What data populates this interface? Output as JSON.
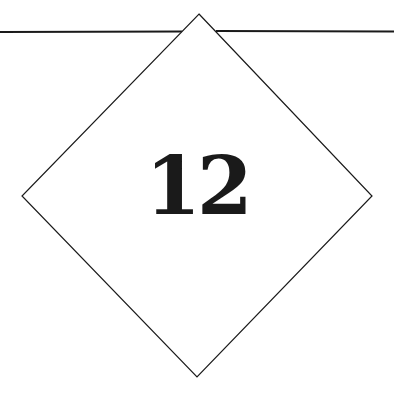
{
  "chapter": {
    "number": "12"
  },
  "colors": {
    "background": "#ffffff",
    "line": "#1a1a1a",
    "text": "#1a1a1a"
  }
}
